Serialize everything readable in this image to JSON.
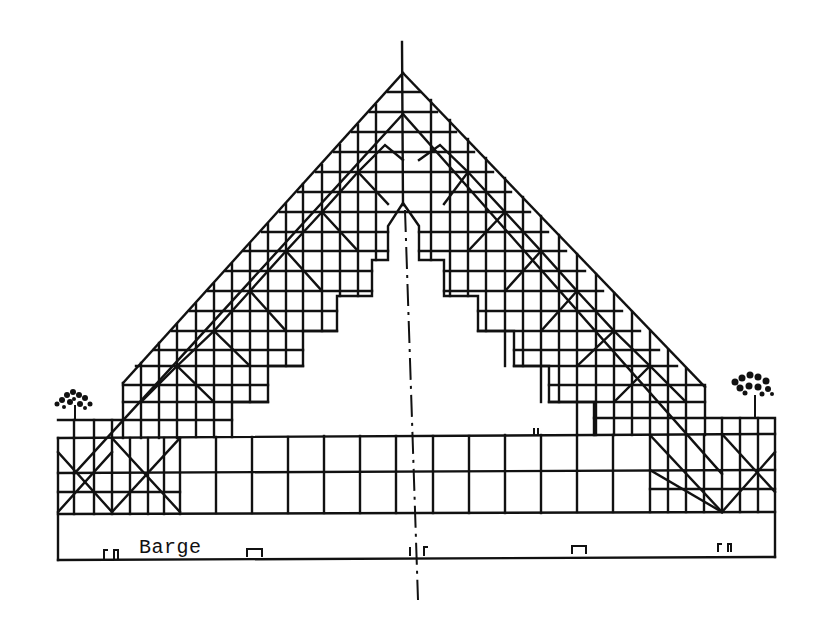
{
  "figure": {
    "type": "architectural elevation sketch",
    "labels": {
      "barge": "Barge"
    },
    "elements": {
      "centerline": "vertical dash-dot axis of symmetry",
      "trees": [
        "left tree",
        "right tree"
      ],
      "bollards": 5
    },
    "colors": {
      "ink": "#111111",
      "paper": "#ffffff"
    }
  }
}
